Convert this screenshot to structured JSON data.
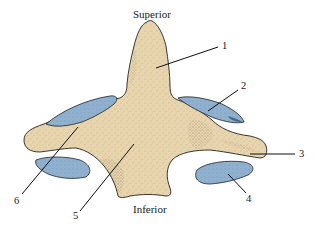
{
  "figure": {
    "orientation": {
      "top": "Superior",
      "bottom": "Inferior"
    },
    "labels": [
      {
        "id": "1",
        "text": "1",
        "x": 222,
        "y": 45
      },
      {
        "id": "2",
        "text": "2",
        "x": 242,
        "y": 85
      },
      {
        "id": "3",
        "text": "3",
        "x": 300,
        "y": 152
      },
      {
        "id": "4",
        "text": "4",
        "x": 246,
        "y": 199
      },
      {
        "id": "5",
        "text": "5",
        "x": 73,
        "y": 216
      },
      {
        "id": "6",
        "text": "6",
        "x": 14,
        "y": 200
      }
    ],
    "colors": {
      "bone": "#E8D5AE",
      "bone_shadow": "#6b5a3e",
      "articular_facet": "#8FB0CE",
      "facet_dark": "#4f6f90",
      "leader_line": "#111111",
      "text": "#222222",
      "background": "#ffffff"
    }
  }
}
